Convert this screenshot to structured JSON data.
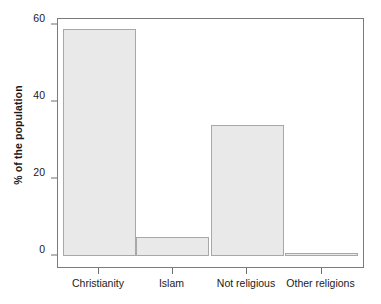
{
  "chart_data": {
    "type": "bar",
    "title": "",
    "xlabel": "",
    "ylabel": "% of the population",
    "categories": [
      "Christianity",
      "Islam",
      "Not religious",
      "Other religions"
    ],
    "values": [
      59,
      5,
      34,
      0.5
    ],
    "ylim": [
      0,
      62
    ],
    "yticks": [
      0,
      20,
      40,
      60
    ],
    "ytick_labels": [
      "0",
      "20",
      "40",
      "60"
    ],
    "grid": false,
    "legend": false,
    "bar_fill_color": "#e9e9e9",
    "bar_edge_color": "#a8a8a8",
    "frame_color": "#7b7b7b",
    "axis_text_color": "#1a1a1a"
  }
}
